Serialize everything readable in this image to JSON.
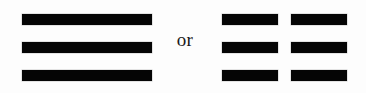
{
  "figure": {
    "background_color": "#fdfdfd",
    "stroke_color": "#050505",
    "conjunction": "or",
    "left_symbol": {
      "name": "qian-trigram",
      "unicode": "☰",
      "description": "three unbroken horizontal lines",
      "line_type": "solid",
      "line_count": 3,
      "segments_per_line": 1
    },
    "right_symbol": {
      "name": "kun-trigram",
      "unicode": "☷",
      "description": "three broken horizontal lines",
      "line_type": "broken",
      "line_count": 3,
      "segments_per_line": 2
    }
  },
  "chart_data": {
    "type": "table",
    "title": "",
    "categories": [
      "line-1",
      "line-2",
      "line-3"
    ],
    "series": [
      {
        "name": "qian-trigram",
        "values": [
          1,
          1,
          1
        ]
      },
      {
        "name": "kun-trigram",
        "values": [
          0,
          0,
          0
        ]
      }
    ],
    "legend": [
      "solid = 1",
      "broken = 0"
    ]
  }
}
